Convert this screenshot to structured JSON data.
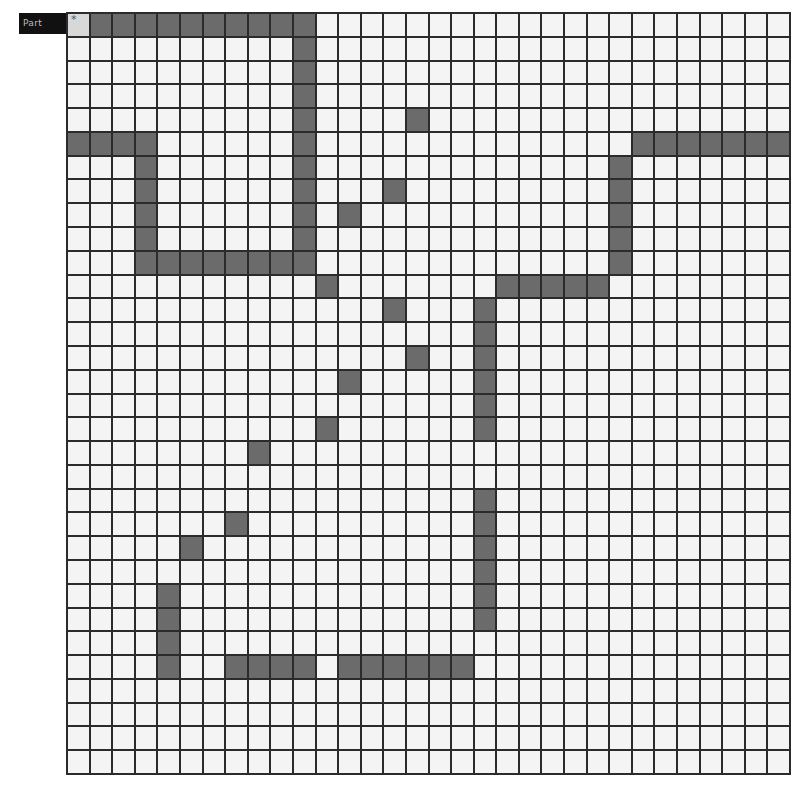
{
  "label": "Part",
  "grid": {
    "rows": 32,
    "cols": 32,
    "colors": {
      "empty": "#f4f4f4",
      "filled": "#6b6b6b",
      "line": "#2b2b2b",
      "label_bg": "#111111"
    },
    "marker_cell": [
      0,
      0
    ],
    "filled_runs": [
      {
        "row": 0,
        "cols": [
          1,
          10
        ]
      },
      {
        "row": 1,
        "cols": [
          10,
          10
        ]
      },
      {
        "row": 2,
        "cols": [
          10,
          10
        ]
      },
      {
        "row": 3,
        "cols": [
          10,
          10
        ]
      },
      {
        "row": 4,
        "cols": [
          10,
          10
        ]
      },
      {
        "row": 4,
        "cols": [
          15,
          15
        ]
      },
      {
        "row": 5,
        "cols": [
          0,
          3
        ]
      },
      {
        "row": 5,
        "cols": [
          10,
          10
        ]
      },
      {
        "row": 5,
        "cols": [
          25,
          31
        ]
      },
      {
        "row": 6,
        "cols": [
          3,
          3
        ]
      },
      {
        "row": 6,
        "cols": [
          10,
          10
        ]
      },
      {
        "row": 6,
        "cols": [
          24,
          24
        ]
      },
      {
        "row": 7,
        "cols": [
          3,
          3
        ]
      },
      {
        "row": 7,
        "cols": [
          10,
          10
        ]
      },
      {
        "row": 7,
        "cols": [
          14,
          14
        ]
      },
      {
        "row": 7,
        "cols": [
          24,
          24
        ]
      },
      {
        "row": 8,
        "cols": [
          3,
          3
        ]
      },
      {
        "row": 8,
        "cols": [
          10,
          10
        ]
      },
      {
        "row": 8,
        "cols": [
          12,
          12
        ]
      },
      {
        "row": 8,
        "cols": [
          24,
          24
        ]
      },
      {
        "row": 9,
        "cols": [
          3,
          3
        ]
      },
      {
        "row": 9,
        "cols": [
          10,
          10
        ]
      },
      {
        "row": 9,
        "cols": [
          24,
          24
        ]
      },
      {
        "row": 10,
        "cols": [
          3,
          10
        ]
      },
      {
        "row": 10,
        "cols": [
          24,
          24
        ]
      },
      {
        "row": 11,
        "cols": [
          11,
          11
        ]
      },
      {
        "row": 11,
        "cols": [
          19,
          23
        ]
      },
      {
        "row": 12,
        "cols": [
          14,
          14
        ]
      },
      {
        "row": 12,
        "cols": [
          18,
          18
        ]
      },
      {
        "row": 13,
        "cols": [
          18,
          18
        ]
      },
      {
        "row": 14,
        "cols": [
          15,
          15
        ]
      },
      {
        "row": 14,
        "cols": [
          18,
          18
        ]
      },
      {
        "row": 15,
        "cols": [
          12,
          12
        ]
      },
      {
        "row": 15,
        "cols": [
          18,
          18
        ]
      },
      {
        "row": 16,
        "cols": [
          18,
          18
        ]
      },
      {
        "row": 17,
        "cols": [
          11,
          11
        ]
      },
      {
        "row": 17,
        "cols": [
          18,
          18
        ]
      },
      {
        "row": 18,
        "cols": [
          8,
          8
        ]
      },
      {
        "row": 20,
        "cols": [
          18,
          18
        ]
      },
      {
        "row": 21,
        "cols": [
          7,
          7
        ]
      },
      {
        "row": 21,
        "cols": [
          18,
          18
        ]
      },
      {
        "row": 22,
        "cols": [
          5,
          5
        ]
      },
      {
        "row": 22,
        "cols": [
          18,
          18
        ]
      },
      {
        "row": 23,
        "cols": [
          18,
          18
        ]
      },
      {
        "row": 24,
        "cols": [
          4,
          4
        ]
      },
      {
        "row": 24,
        "cols": [
          18,
          18
        ]
      },
      {
        "row": 25,
        "cols": [
          4,
          4
        ]
      },
      {
        "row": 25,
        "cols": [
          18,
          18
        ]
      },
      {
        "row": 26,
        "cols": [
          4,
          4
        ]
      },
      {
        "row": 27,
        "cols": [
          4,
          4
        ]
      },
      {
        "row": 27,
        "cols": [
          7,
          10
        ]
      },
      {
        "row": 27,
        "cols": [
          12,
          17
        ]
      }
    ]
  }
}
